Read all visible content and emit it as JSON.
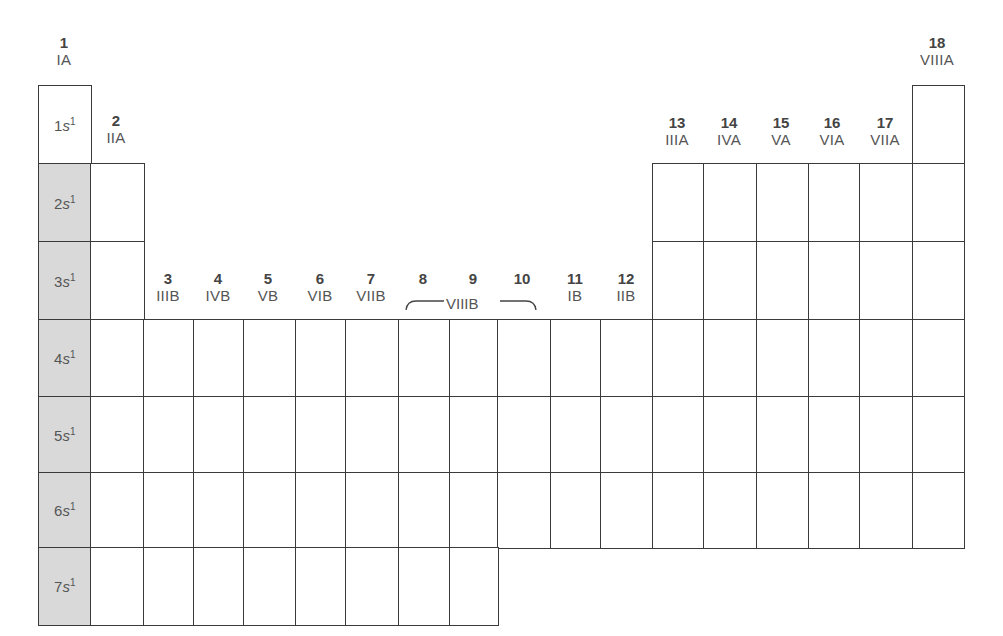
{
  "diagram": {
    "colors": {
      "line": "#3a3a3a",
      "shaded": "#d9d9d9",
      "text": "#555555"
    },
    "group_headers": [
      {
        "number": "1",
        "roman": "IA",
        "x": 64,
        "y": 34
      },
      {
        "number": "2",
        "roman": "IIA",
        "x": 116,
        "y": 112
      },
      {
        "number": "3",
        "roman": "IIIB",
        "x": 168,
        "y": 270
      },
      {
        "number": "4",
        "roman": "IVB",
        "x": 218,
        "y": 270
      },
      {
        "number": "5",
        "roman": "VB",
        "x": 268,
        "y": 270
      },
      {
        "number": "6",
        "roman": "VIB",
        "x": 320,
        "y": 270
      },
      {
        "number": "7",
        "roman": "VIIB",
        "x": 371,
        "y": 270
      },
      {
        "number": "8",
        "roman": "",
        "x": 423,
        "y": 270
      },
      {
        "number": "9",
        "roman": "",
        "x": 473,
        "y": 270
      },
      {
        "number": "10",
        "roman": "",
        "x": 522,
        "y": 270
      },
      {
        "number": "11",
        "roman": "IB",
        "x": 575,
        "y": 270
      },
      {
        "number": "12",
        "roman": "IIB",
        "x": 626,
        "y": 270
      },
      {
        "number": "13",
        "roman": "IIIA",
        "x": 677,
        "y": 114
      },
      {
        "number": "14",
        "roman": "IVA",
        "x": 729,
        "y": 114
      },
      {
        "number": "15",
        "roman": "VA",
        "x": 781,
        "y": 114
      },
      {
        "number": "16",
        "roman": "VIA",
        "x": 832,
        "y": 114
      },
      {
        "number": "17",
        "roman": "VIIA",
        "x": 885,
        "y": 114
      },
      {
        "number": "18",
        "roman": "VIIIA",
        "x": 937,
        "y": 34
      }
    ],
    "viiib_label": "VIIIB",
    "group1_configs": [
      {
        "n": "1",
        "orbital": "s",
        "exp": "1"
      },
      {
        "n": "2",
        "orbital": "s",
        "exp": "1"
      },
      {
        "n": "3",
        "orbital": "s",
        "exp": "1"
      },
      {
        "n": "4",
        "orbital": "s",
        "exp": "1"
      },
      {
        "n": "5",
        "orbital": "s",
        "exp": "1"
      },
      {
        "n": "6",
        "orbital": "s",
        "exp": "1"
      },
      {
        "n": "7",
        "orbital": "s",
        "exp": "1"
      }
    ],
    "grid": {
      "col_edges": [
        38,
        90,
        143,
        193,
        243,
        295,
        345,
        398,
        449,
        497,
        550,
        600,
        652,
        703,
        756,
        808,
        859,
        912,
        963
      ],
      "row_edges": [
        85,
        163,
        241,
        319,
        396,
        472,
        547,
        624
      ],
      "shaded_group": 1,
      "shaded_periods": [
        2,
        3,
        4,
        5,
        6,
        7
      ]
    }
  }
}
